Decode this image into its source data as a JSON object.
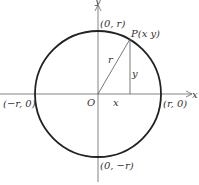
{
  "diagram": {
    "axes": {
      "x_label": "x",
      "y_label": "y",
      "origin_label": "O"
    },
    "intercepts": {
      "top": "(0, r)",
      "bottom": "(0, −r)",
      "left": "(−r, 0)",
      "right": "(r, 0)"
    },
    "point": {
      "label": "P(x  y)"
    },
    "segments": {
      "radius_label": "r",
      "vertical_label": "y",
      "horizontal_label": "x"
    },
    "colors": {
      "circle": "#222222",
      "axes": "#555555",
      "text": "#333333"
    }
  }
}
